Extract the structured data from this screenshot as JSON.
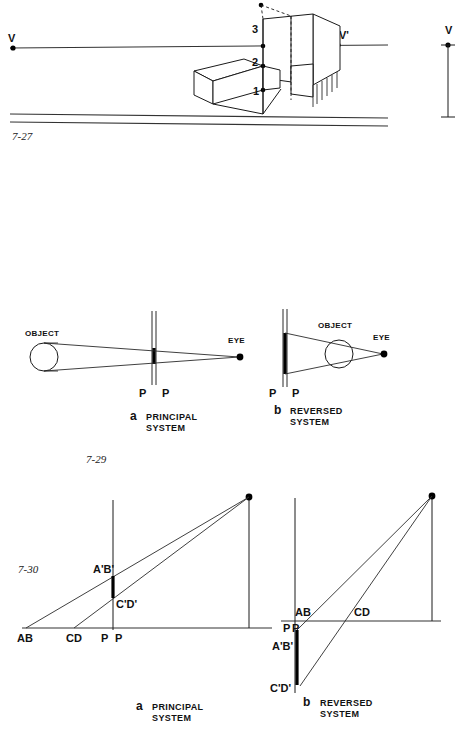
{
  "page": {
    "background": "#ffffff",
    "ink": "#1a1a1a"
  },
  "figures": [
    {
      "id": "fig-7-27",
      "number": "7-27",
      "description": "Two-point perspective of a stepped block massing with horizon line, ground line, left vanishing point V, right vanishing point V prime, numbered corner points and a vertical measuring line V at far right",
      "labels": {
        "vanish_left": "V",
        "vanish_right": "V'",
        "measure_line": "V",
        "point_1": "1",
        "point_2": "2",
        "point_3": "3"
      }
    },
    {
      "id": "fig-7-29",
      "number": "7-29",
      "description": "Plan view comparison of principal and reversed perspective systems showing object, picture plane P-P and eye",
      "panels": [
        {
          "letter": "a",
          "caption_line1": "PRINCIPAL",
          "caption_line2": "SYSTEM",
          "object_label": "OBJECT",
          "eye_label": "EYE",
          "plane_label_left": "P",
          "plane_label_right": "P"
        },
        {
          "letter": "b",
          "caption_line1": "REVERSED",
          "caption_line2": "SYSTEM",
          "object_label": "OBJECT",
          "eye_label": "EYE",
          "plane_label_left": "P",
          "plane_label_right": "P"
        }
      ]
    },
    {
      "id": "fig-7-30",
      "number": "7-30",
      "description": "Elevation comparison of principal and reversed systems showing true lengths AB and CD projected to the picture plane as A prime B prime and C prime D prime",
      "panels": [
        {
          "letter": "a",
          "caption_line1": "PRINCIPAL",
          "caption_line2": "SYSTEM",
          "labels": {
            "ab": "AB",
            "cd": "CD",
            "pp_left": "P",
            "pp_right": "P",
            "ab_prime": "A'B'",
            "cd_prime": "C'D'"
          }
        },
        {
          "letter": "b",
          "caption_line1": "REVERSED",
          "caption_line2": "SYSTEM",
          "labels": {
            "ab": "AB",
            "cd": "CD",
            "pp_left": "P",
            "pp_right": "P",
            "ab_prime": "A'B'",
            "cd_prime": "C'D'"
          }
        }
      ]
    }
  ]
}
